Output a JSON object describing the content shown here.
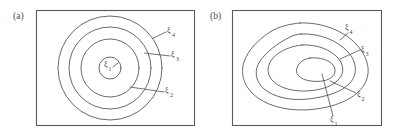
{
  "figure": {
    "kind": "two-panel-contour-diagram",
    "background_color": "#ffffff",
    "line_color": "#4f4f4f",
    "frame_color": "#5b5b5b",
    "panels": [
      {
        "caption": "(a)",
        "description": "four concentric circular level curves",
        "frame": {
          "x": 36,
          "y": 10,
          "width": 159,
          "height": 116
        },
        "center": {
          "x": 110,
          "y": 68
        },
        "contours": [
          {
            "label": "ξ",
            "subscript": "1",
            "radius": 11
          },
          {
            "label": "ξ",
            "subscript": "2",
            "radius": 29
          },
          {
            "label": "ξ",
            "subscript": "3",
            "radius": 41
          },
          {
            "label": "ξ",
            "subscript": "4",
            "radius": 52
          }
        ],
        "labels": [
          {
            "text": "ξ",
            "sub": "1",
            "x": 106,
            "y": 71,
            "inside": true
          },
          {
            "text": "ξ",
            "sub": "2",
            "x": 166,
            "y": 96,
            "inside": false
          },
          {
            "text": "ξ",
            "sub": "3",
            "x": 172,
            "y": 60,
            "inside": false
          },
          {
            "text": "ξ",
            "sub": "4",
            "x": 168,
            "y": 36,
            "inside": false
          }
        ]
      },
      {
        "caption": "(b)",
        "description": "four nested irregular closed level curves",
        "frame": {
          "x": 232,
          "y": 10,
          "width": 150,
          "height": 116
        },
        "center": {
          "x": 310,
          "y": 70
        },
        "contours": [
          {
            "label": "ξ",
            "subscript": "1",
            "level": "innermost"
          },
          {
            "label": "ξ",
            "subscript": "2",
            "level": "second"
          },
          {
            "label": "ξ",
            "subscript": "3",
            "level": "third"
          },
          {
            "label": "ξ",
            "subscript": "4",
            "level": "outermost"
          }
        ],
        "labels": [
          {
            "text": "ξ",
            "sub": "1",
            "x": 333,
            "y": 122,
            "inside": false
          },
          {
            "text": "ξ",
            "sub": "2",
            "x": 357,
            "y": 98,
            "inside": false
          },
          {
            "text": "ξ",
            "sub": "3",
            "x": 362,
            "y": 55,
            "inside": false
          },
          {
            "text": "ξ",
            "sub": "4",
            "x": 347,
            "y": 31,
            "inside": false
          }
        ]
      }
    ]
  }
}
